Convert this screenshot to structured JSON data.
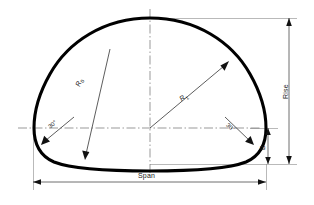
{
  "diagram": {
    "outline_name": "arch-profile",
    "colors": {
      "outline": "#000000",
      "dimension_line": "#555555",
      "center_line": "#777777",
      "leader_line": "#444444",
      "background": "#ffffff",
      "text": "#1a1a1a"
    },
    "labels": {
      "span": "Span",
      "rise": "Rise",
      "b": "B",
      "radius_left": "R",
      "radius_left_sub": "0",
      "radius_right": "R",
      "radius_right_sub": "1",
      "angle_left": "30°",
      "angle_right": "30°"
    },
    "dimensions": {
      "span_line_y": 182,
      "rise_line_x": 289,
      "b_line_x": 266,
      "center_x": 150,
      "center_y": 128,
      "crown_y": 18,
      "springing_y": 128,
      "base_y": 164
    }
  }
}
